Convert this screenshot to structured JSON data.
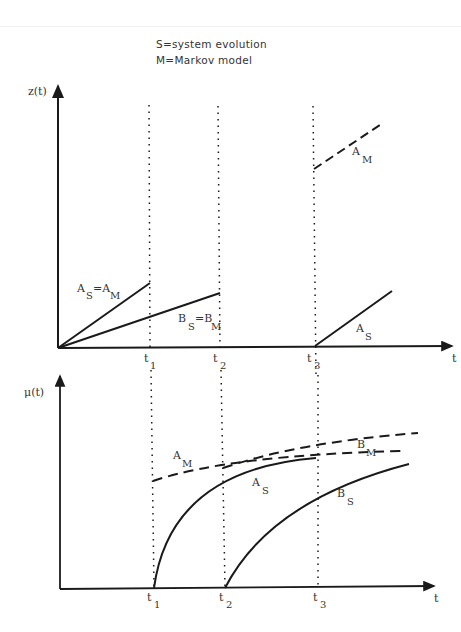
{
  "legend": {
    "line1": "S=system evolution",
    "line2": "M=Markov model"
  },
  "top_panel": {
    "y_axis_label": "z(t)",
    "x_axis_label": "t",
    "ticks": [
      {
        "base": "t",
        "sub": "1"
      },
      {
        "base": "t",
        "sub": "2"
      },
      {
        "base": "t",
        "sub": "3"
      }
    ],
    "curve_labels": {
      "as_am": {
        "a": "A",
        "a_sub": "S",
        "eq": "=A",
        "eq_sub": "M"
      },
      "bs_bm": {
        "a": "B",
        "a_sub": "S",
        "eq": "=B",
        "eq_sub": "M"
      },
      "am": {
        "base": "A",
        "sub": "M"
      },
      "as": {
        "base": "A",
        "sub": "S"
      }
    }
  },
  "bottom_panel": {
    "y_axis_label": "μ(t)",
    "x_axis_label": "t",
    "ticks": [
      {
        "base": "t",
        "sub": "1"
      },
      {
        "base": "t",
        "sub": "2"
      },
      {
        "base": "t",
        "sub": "3"
      }
    ],
    "curve_labels": {
      "am": {
        "base": "A",
        "sub": "M"
      },
      "as": {
        "base": "A",
        "sub": "S"
      },
      "bm": {
        "base": "B",
        "sub": "M"
      },
      "bs": {
        "base": "B",
        "sub": "S"
      }
    }
  },
  "colors": {
    "line": "#1a1a1a",
    "text": "#333333",
    "background": "#ffffff"
  }
}
